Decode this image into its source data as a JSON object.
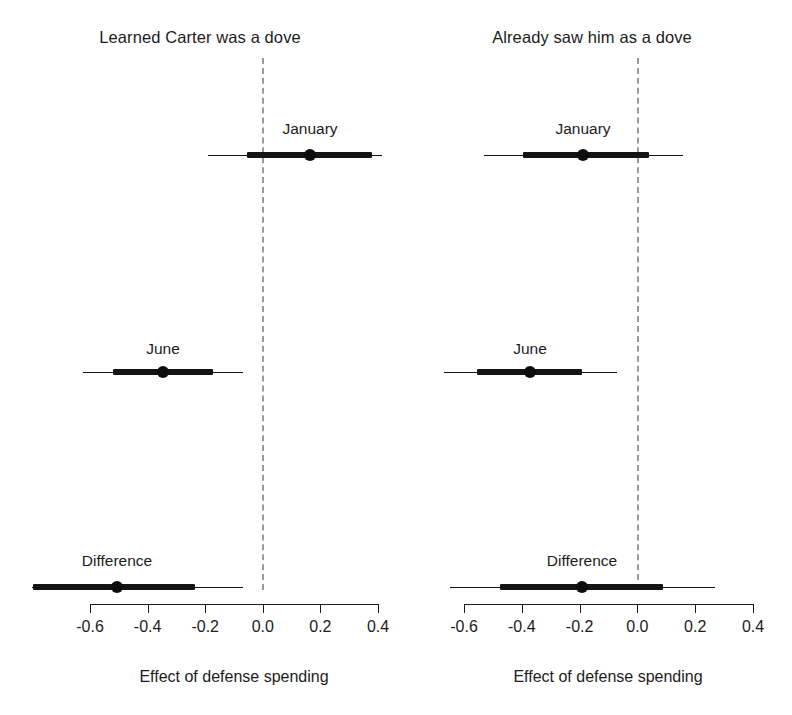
{
  "figure": {
    "width": 792,
    "height": 715,
    "background": "#ffffff",
    "ink_color": "#141414",
    "zero_line_color": "#9a9a9a"
  },
  "chart_data": {
    "type": "scatter",
    "subtype": "coefficient-plot",
    "title": "",
    "xlabel": "Effect of defense spending",
    "ylabel": "",
    "grid": false,
    "legend": "none",
    "zero_reference_line": 0.0,
    "panels": [
      {
        "id": "learned-carter-was-a-dove",
        "title": "Learned Carter was a dove",
        "xlabel": "Effect of defense spending",
        "xlim": [
          -0.6,
          0.4
        ],
        "xticks": [
          -0.6,
          -0.4,
          -0.2,
          0.0,
          0.2,
          0.4
        ],
        "xticklabels": [
          "-0.6",
          "-0.4",
          "-0.2",
          "0.0",
          "0.2",
          "0.4"
        ],
        "rows": [
          {
            "label": "January",
            "estimate": 0.17,
            "ci_outer": [
              -0.19,
              0.42
            ],
            "ci_inner": [
              -0.05,
              0.38
            ]
          },
          {
            "label": "June",
            "estimate": -0.34,
            "ci_outer": [
              -0.62,
              -0.07
            ],
            "ci_inner": [
              -0.52,
              -0.17
            ]
          },
          {
            "label": "Difference",
            "estimate": -0.5,
            "ci_outer": [
              -0.8,
              -0.07
            ],
            "ci_inner": [
              -0.79,
              -0.23
            ]
          }
        ]
      },
      {
        "id": "already-saw-him-as-a-dove",
        "title": "Already saw him as a dove",
        "xlabel": "Effect of defense spending",
        "xlim": [
          -0.6,
          0.4
        ],
        "xticks": [
          -0.6,
          -0.4,
          -0.2,
          0.0,
          0.2,
          0.4
        ],
        "xticklabels": [
          "-0.6",
          "-0.4",
          "-0.2",
          "0.0",
          "0.2",
          "0.4"
        ],
        "rows": [
          {
            "label": "January",
            "estimate": -0.19,
            "ci_outer": [
              -0.53,
              0.16
            ],
            "ci_inner": [
              -0.4,
              0.04
            ]
          },
          {
            "label": "June",
            "estimate": -0.37,
            "ci_outer": [
              -0.67,
              -0.07
            ],
            "ci_inner": [
              -0.55,
              -0.19
            ]
          },
          {
            "label": "Difference",
            "estimate": -0.19,
            "ci_outer": [
              -0.65,
              0.27
            ],
            "ci_inner": [
              -0.47,
              0.09
            ]
          }
        ]
      }
    ]
  },
  "layout": {
    "panel_geometry": [
      {
        "panel_left": 0,
        "x_at_min": 90,
        "x_at_max": 378,
        "axis_y": 604,
        "axis_title_y": 668,
        "axis_title_x": 234,
        "row_y": [
          155,
          372,
          587
        ],
        "label_y": [
          120,
          340,
          552
        ],
        "zero_x": 262,
        "line_ends": [
          {
            "outer": [
              207.7,
              381.7
            ],
            "inner": [
              246.7,
              371.7
            ],
            "point": 310
          },
          {
            "outer": [
              83.3,
              243.3
            ],
            "inner": [
              112.7,
              213.3
            ],
            "point": 163
          },
          {
            "outer": [
              31.7,
              243.3
            ],
            "inner": [
              33.3,
              195.0
            ],
            "point": 117
          }
        ],
        "label_x": [
          310,
          163,
          117
        ],
        "title_center_x": 196
      },
      {
        "panel_left": 0,
        "x_at_min": 464,
        "x_at_max": 753,
        "axis_y": 604,
        "axis_title_y": 668,
        "axis_title_x": 608,
        "row_y": [
          155,
          372,
          587
        ],
        "label_y": [
          120,
          340,
          552
        ],
        "zero_x": 637,
        "line_ends": [
          {
            "outer": [
              484.0,
              682.7
            ],
            "inner": [
              522.7,
              649.3
            ],
            "point": 583
          },
          {
            "outer": [
              444.0,
              616.7
            ],
            "inner": [
              476.7,
              582.3
            ],
            "point": 530
          },
          {
            "outer": [
              450.0,
              715.0
            ],
            "inner": [
              500.0,
              663.3
            ],
            "point": 582
          }
        ],
        "label_x": [
          583,
          530,
          582
        ],
        "title_center_x": 600
      }
    ]
  }
}
